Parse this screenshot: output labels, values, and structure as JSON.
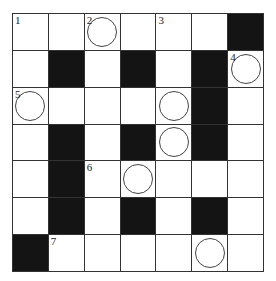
{
  "puzzle": {
    "type": "crossword",
    "rows": 7,
    "cols": 7,
    "cells": [
      [
        {
          "n": "1"
        },
        {},
        {
          "n": "2",
          "c": true
        },
        {},
        {
          "n": "3"
        },
        {},
        {
          "b": true
        }
      ],
      [
        {},
        {
          "b": true
        },
        {},
        {
          "b": true
        },
        {},
        {
          "b": true
        },
        {
          "n": "4",
          "c": true
        }
      ],
      [
        {
          "n": "5",
          "c": true
        },
        {},
        {},
        {},
        {
          "c": true
        },
        {
          "b": true
        },
        {}
      ],
      [
        {},
        {
          "b": true
        },
        {},
        {
          "b": true
        },
        {
          "c": true
        },
        {
          "b": true
        },
        {}
      ],
      [
        {},
        {
          "b": true
        },
        {
          "n": "6"
        },
        {
          "c": true
        },
        {},
        {},
        {}
      ],
      [
        {},
        {
          "b": true
        },
        {},
        {
          "b": true
        },
        {},
        {
          "b": true
        },
        {}
      ],
      [
        {
          "b": true
        },
        {
          "n": "7"
        },
        {},
        {},
        {},
        {
          "c": true
        },
        {}
      ]
    ]
  }
}
